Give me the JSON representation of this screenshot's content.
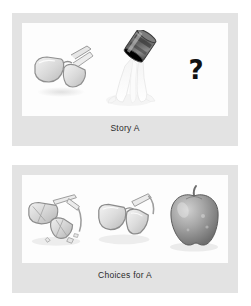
{
  "sheet": {
    "background_color": "#ffffff",
    "frame_color": "#e3e3e3",
    "stage_color": "#fdfdfd"
  },
  "panels": [
    {
      "id": "story",
      "caption": "Story A",
      "items": [
        {
          "name": "eyeglasses",
          "kind": "illustration",
          "alt": "pair of eyeglasses"
        },
        {
          "name": "pouring-can",
          "kind": "illustration",
          "alt": "tipped can pouring white liquid"
        },
        {
          "name": "question-mark",
          "kind": "glyph",
          "glyph": "?",
          "color": "#111111"
        }
      ]
    },
    {
      "id": "choices",
      "caption": "Choices for A",
      "items": [
        {
          "name": "broken-eyeglasses",
          "kind": "illustration",
          "alt": "broken eyeglasses with shattered lens pieces"
        },
        {
          "name": "intact-eyeglasses",
          "kind": "illustration",
          "alt": "intact pair of eyeglasses"
        },
        {
          "name": "apple",
          "kind": "illustration",
          "alt": "red apple with stem"
        }
      ]
    }
  ]
}
